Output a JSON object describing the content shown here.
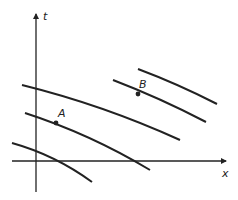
{
  "diagram": {
    "type": "characteristic-lines",
    "axes": {
      "horizontal_label": "x",
      "vertical_label": "t"
    },
    "curves": [
      {
        "id": "curve-1",
        "d": "M138,69 Q178,84 217,104"
      },
      {
        "id": "curve-2",
        "d": "M113,80 Q160,98 206,122"
      },
      {
        "id": "curve-3",
        "d": "M22,85 Q103,105 180,140"
      },
      {
        "id": "curve-4",
        "d": "M25,113 Q90,134 150,170"
      },
      {
        "id": "curve-5",
        "d": "M12,143 Q55,155 92,182"
      }
    ],
    "points": [
      {
        "label": "A",
        "x": 56,
        "y": 123,
        "label_x": 58,
        "label_y": 117
      },
      {
        "label": "B",
        "x": 138,
        "y": 94,
        "label_x": 139,
        "label_y": 88
      }
    ],
    "colors": {
      "stroke": "#222222",
      "background": "#ffffff"
    }
  }
}
